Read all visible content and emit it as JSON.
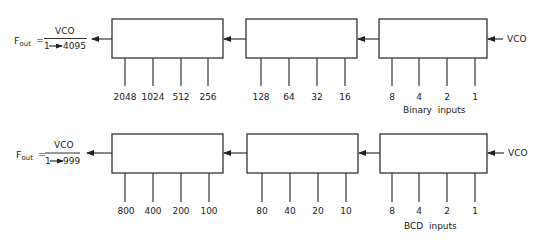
{
  "diagram": {
    "rows": [
      {
        "id": "binary",
        "formula": {
          "lhs": "F",
          "lhs_sub": "out",
          "equals": "=",
          "numerator": "VCO",
          "denominator": "1→ 4095",
          "denominator_start": "1",
          "denominator_end": "4095"
        },
        "input_signal": "VCO",
        "stages": [
          {
            "id": "stage-msb",
            "inputs": [
              "2048",
              "1024",
              "512",
              "256"
            ]
          },
          {
            "id": "stage-mid",
            "inputs": [
              "128",
              "64",
              "32",
              "16"
            ]
          },
          {
            "id": "stage-lsb",
            "inputs": [
              "8",
              "4",
              "2",
              "1"
            ]
          }
        ],
        "caption": "Binary  inputs"
      },
      {
        "id": "bcd",
        "formula": {
          "lhs": "F",
          "lhs_sub": "out",
          "equals": "=",
          "numerator": "VCO",
          "denominator": "1→ 999",
          "denominator_start": "1",
          "denominator_end": "999"
        },
        "input_signal": "VCO",
        "stages": [
          {
            "id": "stage-hundreds",
            "inputs": [
              "800",
              "400",
              "200",
              "100"
            ]
          },
          {
            "id": "stage-tens",
            "inputs": [
              "80",
              "40",
              "20",
              "10"
            ]
          },
          {
            "id": "stage-units",
            "inputs": [
              "8",
              "4",
              "2",
              "1"
            ]
          }
        ],
        "caption": "BCD  inputs"
      }
    ],
    "colors": {
      "line": "#333333",
      "text": "#222222",
      "background": "#ffffff"
    }
  }
}
